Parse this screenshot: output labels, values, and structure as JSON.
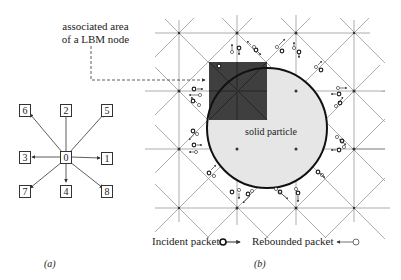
{
  "annotation": {
    "line1": "associated area",
    "line2": "of a LBM node"
  },
  "panel_a": {
    "caption": "(a)",
    "center_node": "0",
    "directions": [
      "1",
      "2",
      "3",
      "4",
      "5",
      "6",
      "7",
      "8"
    ]
  },
  "panel_b": {
    "caption": "(b)",
    "particle_label": "solid particle"
  },
  "legend": {
    "incident": "Incident packet",
    "rebounded": "Rebounded packet"
  },
  "colors": {
    "grid_line": "#8a8a8a",
    "particle_fill": "#e6e6e6",
    "particle_border": "#111111",
    "associated_area": "#3f3f3f",
    "box_border": "#333333"
  }
}
